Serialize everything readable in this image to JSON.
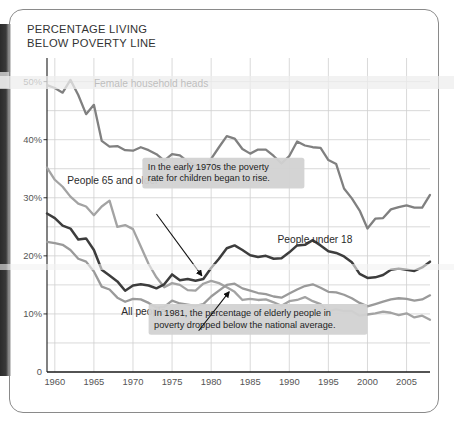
{
  "title": "PERCENTAGE LIVING\nBELOW POVERTY LINE",
  "colors": {
    "under18": "#3d3d3d",
    "female_heads": "#808080",
    "elderly": "#a3a3a3",
    "all_people": "#9a9a9a",
    "grid": "#cfcfcf",
    "axis": "#1a1a1a",
    "callout_bg": "#d2d2d2",
    "text": "#333333"
  },
  "chart_data": {
    "type": "line",
    "title": "PERCENTAGE LIVING BELOW POVERTY LINE",
    "xlabel": "",
    "ylabel": "",
    "xlim": [
      1959,
      2008
    ],
    "ylim": [
      0,
      52
    ],
    "grid": true,
    "legend_position": "inline-labels",
    "xticks": [
      1960,
      1965,
      1970,
      1975,
      1980,
      1985,
      1990,
      1995,
      2000,
      2005
    ],
    "xtick_labels": [
      "1960",
      "1965",
      "1970",
      "1975",
      "1980",
      "1985",
      "1990",
      "1995",
      "2000",
      "2005"
    ],
    "yticks": [
      0,
      10,
      20,
      30,
      40,
      50
    ],
    "ytick_labels": [
      "0",
      "10%",
      "20%",
      "30%",
      "40%",
      "50%"
    ],
    "x": [
      1959,
      1960,
      1961,
      1962,
      1963,
      1964,
      1965,
      1966,
      1967,
      1968,
      1969,
      1970,
      1971,
      1972,
      1973,
      1974,
      1975,
      1976,
      1977,
      1978,
      1979,
      1980,
      1981,
      1982,
      1983,
      1984,
      1985,
      1986,
      1987,
      1988,
      1989,
      1990,
      1991,
      1992,
      1993,
      1994,
      1995,
      1996,
      1997,
      1998,
      1999,
      2000,
      2001,
      2002,
      2003,
      2004,
      2005,
      2006,
      2007,
      2008
    ],
    "series": [
      {
        "name": "Female household heads",
        "color": "#808080",
        "values": [
          49.4,
          48.9,
          48.1,
          50.3,
          47.7,
          44.4,
          46.0,
          39.8,
          38.8,
          38.9,
          38.2,
          38.1,
          38.7,
          38.2,
          37.5,
          36.4,
          37.5,
          37.3,
          36.2,
          35.6,
          34.9,
          36.7,
          38.7,
          40.6,
          40.2,
          38.4,
          37.6,
          38.3,
          38.3,
          37.2,
          35.9,
          37.2,
          39.7,
          39.0,
          38.7,
          38.6,
          36.5,
          35.8,
          31.6,
          29.9,
          27.8,
          24.7,
          26.4,
          26.5,
          28.0,
          28.4,
          28.7,
          28.3,
          28.3,
          30.5
        ]
      },
      {
        "name": "People 65 and older",
        "color": "#a3a3a3",
        "values": [
          35.2,
          33.1,
          31.9,
          30.2,
          29.0,
          28.5,
          27.0,
          28.5,
          29.5,
          25.0,
          25.3,
          24.6,
          21.6,
          18.6,
          16.3,
          14.6,
          15.3,
          15.0,
          14.1,
          14.0,
          15.2,
          15.7,
          15.3,
          14.6,
          13.8,
          12.4,
          12.6,
          12.4,
          12.5,
          12.0,
          11.4,
          12.2,
          12.4,
          12.9,
          12.2,
          11.7,
          10.5,
          10.8,
          10.5,
          10.5,
          9.7,
          9.9,
          10.1,
          10.4,
          10.2,
          9.8,
          10.1,
          9.4,
          9.7,
          9.0
        ]
      },
      {
        "name": "People under 18",
        "color": "#3d3d3d",
        "values": [
          27.3,
          26.5,
          25.2,
          24.7,
          22.8,
          23.0,
          21.0,
          17.6,
          16.6,
          15.6,
          14.0,
          14.9,
          15.1,
          14.9,
          14.4,
          15.1,
          16.8,
          15.8,
          16.0,
          15.7,
          16.0,
          17.9,
          19.5,
          21.3,
          21.8,
          21.0,
          20.1,
          19.8,
          20.0,
          19.5,
          19.6,
          20.6,
          21.8,
          21.9,
          22.7,
          21.8,
          20.8,
          20.5,
          19.9,
          18.9,
          16.9,
          16.2,
          16.3,
          16.7,
          17.6,
          17.8,
          17.6,
          17.4,
          18.0,
          19.0
        ]
      },
      {
        "name": "All people",
        "color": "#9a9a9a",
        "values": [
          22.4,
          22.2,
          21.9,
          21.0,
          19.5,
          19.0,
          17.3,
          14.7,
          14.2,
          12.8,
          12.1,
          12.6,
          12.5,
          11.9,
          11.1,
          11.2,
          12.3,
          11.8,
          11.6,
          11.4,
          11.7,
          13.0,
          14.0,
          15.0,
          15.2,
          14.4,
          14.0,
          13.6,
          13.4,
          13.0,
          12.8,
          13.5,
          14.2,
          14.8,
          15.1,
          14.5,
          13.8,
          13.7,
          13.3,
          12.7,
          11.9,
          11.3,
          11.7,
          12.1,
          12.5,
          12.7,
          12.6,
          12.3,
          12.5,
          13.2
        ]
      }
    ],
    "series_labels": [
      {
        "text": "Female household heads",
        "x": 1965.0,
        "y": 49.6
      },
      {
        "text": "People 65 and older",
        "x": 1961.6,
        "y": 33.0
      },
      {
        "text": "People under 18",
        "x": 1988.5,
        "y": 22.9
      },
      {
        "text": "All people",
        "x": 1968.5,
        "y": 10.4
      }
    ],
    "annotations": [
      {
        "text": "In the early 1970s the poverty\nrate for children began to rise.",
        "box_x": 1971.2,
        "box_y": 31.6,
        "arrow_from_x": 1973.0,
        "arrow_from_y": 27.2,
        "arrow_to_x": 1978.8,
        "arrow_to_y": 16.6
      },
      {
        "text": "In 1981, the percentage of elderly people in\npoverty dropped below the national average.",
        "box_x": 1972.0,
        "box_y": 6.4,
        "arrow_from_x": 1978.4,
        "arrow_from_y": 7.1,
        "arrow_to_x": 1982.3,
        "arrow_to_y": 13.8
      }
    ]
  }
}
